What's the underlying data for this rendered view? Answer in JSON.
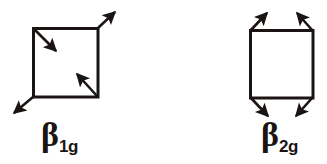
{
  "diagram": {
    "stroke_color": "#1a1512",
    "background_color": "#ffffff",
    "figures": [
      {
        "id": "beta-1g",
        "label_symbol": "β",
        "label_subscript": "1g",
        "shape": "square",
        "square": {
          "x1": 33,
          "y1": 28,
          "x2": 98,
          "y2": 97
        },
        "arrows": [
          {
            "name": "top-left-inward-arrow",
            "x1": 34,
            "y1": 29,
            "x2": 58,
            "y2": 53,
            "direction": "down-right",
            "sense": "inward"
          },
          {
            "name": "top-right-outward-arrow",
            "x1": 98,
            "y1": 28,
            "x2": 117,
            "y2": 10,
            "direction": "up-right",
            "sense": "outward"
          },
          {
            "name": "bottom-right-inward-arrow",
            "x1": 97,
            "y1": 96,
            "x2": 75,
            "y2": 72,
            "direction": "up-left",
            "sense": "inward"
          },
          {
            "name": "bottom-left-outward-arrow",
            "x1": 33,
            "y1": 97,
            "x2": 12,
            "y2": 115,
            "direction": "down-left",
            "sense": "outward"
          }
        ]
      },
      {
        "id": "beta-2g",
        "label_symbol": "β",
        "label_subscript": "2g",
        "shape": "square",
        "square": {
          "x1": 250,
          "y1": 30,
          "x2": 313,
          "y2": 98
        },
        "arrows": [
          {
            "name": "top-left-outward-arrow",
            "x1": 250,
            "y1": 31,
            "x2": 269,
            "y2": 11,
            "direction": "up-right",
            "sense": "outward"
          },
          {
            "name": "top-right-outward-arrow",
            "x1": 313,
            "y1": 31,
            "x2": 295,
            "y2": 11,
            "direction": "up-left",
            "sense": "outward"
          },
          {
            "name": "bottom-left-outward-arrow",
            "x1": 250,
            "y1": 97,
            "x2": 270,
            "y2": 118,
            "direction": "down-right",
            "sense": "outward"
          },
          {
            "name": "bottom-right-outward-arrow",
            "x1": 313,
            "y1": 97,
            "x2": 294,
            "y2": 118,
            "direction": "down-left",
            "sense": "outward"
          }
        ]
      }
    ]
  }
}
